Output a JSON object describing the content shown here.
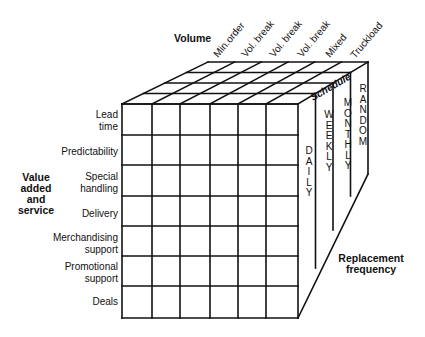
{
  "diagram": {
    "axes": {
      "volume": {
        "title": "Volume",
        "items": [
          "Min.order",
          "Vol. break",
          "Vol. break",
          "Vol. break",
          "Mixed",
          "Truckload"
        ]
      },
      "value_added": {
        "title_lines": [
          "Value",
          "added",
          "and",
          "service"
        ],
        "items": [
          [
            "Lead",
            "time"
          ],
          [
            "Predictability"
          ],
          [
            "Special",
            "handling"
          ],
          [
            "Delivery"
          ],
          [
            "Merchandising",
            "support"
          ],
          [
            "Promotional",
            "support"
          ],
          [
            "Deals"
          ]
        ]
      },
      "schedule": {
        "title": "Schedule",
        "items": [
          "DAILY",
          "WEEKLY",
          "MONTHLY",
          "RANDOM"
        ]
      },
      "replacement_frequency": {
        "title_lines": [
          "Replacement",
          "frequency"
        ]
      }
    },
    "colors": {
      "line": "#111111",
      "text": "#111111",
      "background": "#ffffff"
    }
  }
}
